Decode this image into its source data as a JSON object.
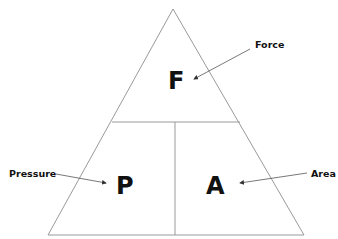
{
  "diagram": {
    "cells": {
      "top": {
        "letter": "F",
        "label": "Force"
      },
      "bottom_left": {
        "letter": "P",
        "label": "Pressure"
      },
      "bottom_right": {
        "letter": "A",
        "label": "Area"
      }
    },
    "colors": {
      "line": "#9a9a9a",
      "text": "#111111",
      "arrow": "#555555",
      "background": "#ffffff"
    }
  }
}
